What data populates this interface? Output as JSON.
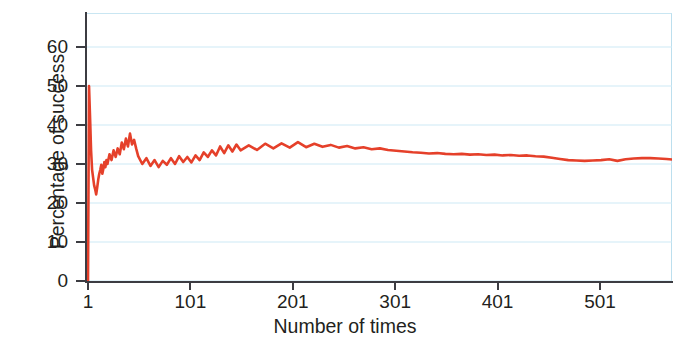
{
  "figure": {
    "title_remnant": "· ·",
    "background_color": "#ffffff"
  },
  "axes": {
    "y_title": "Percentage of success",
    "x_title": "Number of times",
    "y_ticks": [
      "0",
      "10",
      "20",
      "30",
      "40",
      "50",
      "60"
    ],
    "x_ticks": [
      "1",
      "101",
      "201",
      "301",
      "401",
      "501"
    ],
    "grid_color": "#cde9f5",
    "spine_color": "#3c3c42"
  },
  "chart_data": {
    "type": "line",
    "title": "",
    "subtitle": "",
    "xlabel": "Number of times",
    "ylabel": "Percentage of success",
    "xlim": [
      1,
      576
    ],
    "ylim": [
      0,
      64
    ],
    "x_ticks": [
      1,
      101,
      201,
      301,
      401,
      501
    ],
    "y_ticks": [
      0,
      10,
      20,
      30,
      40,
      50,
      60
    ],
    "grid": true,
    "grid_axis": "y",
    "legend": false,
    "legend_position": "none",
    "line_color": "#e5402a",
    "line_width": 2.6,
    "annotations": [
      "Y axis top label '60' is clipped by the top edge of the screenshot",
      "A figure caption above the plot is cropped off the top of the image"
    ],
    "series": [
      {
        "name": "Percentage of success",
        "x": [
          1,
          2,
          3,
          4,
          5,
          6,
          7,
          8,
          9,
          10,
          11,
          12,
          13,
          14,
          15,
          16,
          17,
          18,
          19,
          20,
          22,
          24,
          26,
          28,
          30,
          32,
          34,
          36,
          38,
          40,
          42,
          44,
          46,
          48,
          50,
          54,
          58,
          62,
          66,
          70,
          74,
          78,
          82,
          86,
          90,
          94,
          98,
          102,
          106,
          110,
          114,
          118,
          122,
          126,
          130,
          134,
          138,
          142,
          146,
          150,
          158,
          166,
          174,
          182,
          190,
          198,
          206,
          214,
          222,
          230,
          238,
          246,
          254,
          262,
          270,
          278,
          286,
          294,
          302,
          310,
          318,
          326,
          334,
          342,
          350,
          358,
          366,
          374,
          382,
          390,
          398,
          406,
          414,
          422,
          430,
          438,
          446,
          454,
          462,
          470,
          478,
          486,
          494,
          502,
          510,
          518,
          526,
          534,
          542,
          550,
          558,
          566,
          576
        ],
        "values": [
          0,
          50,
          42,
          33.5,
          28.5,
          26.5,
          24.5,
          23.5,
          22.2,
          24.0,
          26.0,
          27.5,
          28.5,
          29.8,
          27.5,
          28.8,
          30.5,
          29.2,
          31.0,
          30.0,
          32.5,
          31.0,
          33.5,
          31.8,
          34.0,
          32.5,
          35.5,
          33.8,
          36.5,
          34.5,
          37.8,
          35.0,
          36.2,
          34.0,
          32.0,
          30.0,
          31.5,
          29.5,
          31.0,
          29.2,
          30.8,
          29.8,
          31.5,
          30.0,
          32.0,
          30.5,
          31.8,
          30.4,
          32.2,
          31.0,
          33.0,
          31.8,
          33.5,
          32.2,
          34.5,
          32.8,
          34.8,
          33.2,
          35.0,
          33.5,
          34.8,
          33.6,
          35.2,
          34.0,
          35.3,
          34.2,
          35.6,
          34.3,
          35.2,
          34.4,
          34.9,
          34.2,
          34.6,
          34.0,
          34.3,
          33.8,
          34.0,
          33.6,
          33.4,
          33.2,
          33.0,
          32.9,
          32.7,
          32.8,
          32.6,
          32.5,
          32.6,
          32.4,
          32.5,
          32.3,
          32.4,
          32.2,
          32.3,
          32.1,
          32.2,
          32.0,
          31.9,
          31.6,
          31.3,
          31.0,
          30.9,
          30.8,
          30.9,
          31.0,
          31.2,
          30.8,
          31.2,
          31.4,
          31.5,
          31.5,
          31.4,
          31.3,
          31.0
        ]
      }
    ]
  }
}
